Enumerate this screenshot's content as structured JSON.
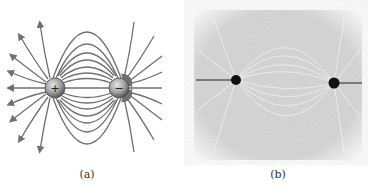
{
  "figure": {
    "panels": [
      {
        "id": "a",
        "caption": "(a)",
        "type": "electric dipole field-line diagram",
        "charges": [
          {
            "sign": "+",
            "label": "+",
            "x": 55,
            "y": 88
          },
          {
            "sign": "-",
            "label": "−",
            "x": 119,
            "y": 88
          }
        ]
      },
      {
        "id": "b",
        "caption": "(b)",
        "type": "photograph of dipole field pattern (grass seeds / fibers)"
      }
    ],
    "colors": {
      "line": "#707070",
      "charge_fill": "#9a9a9a",
      "photo_bg": "#d8d8d8",
      "photo_dot": "#111111"
    }
  }
}
